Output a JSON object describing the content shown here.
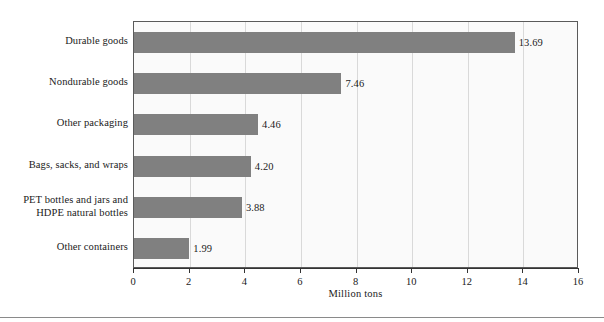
{
  "chart_data": {
    "type": "bar",
    "orientation": "horizontal",
    "title": "",
    "subtitle": "",
    "xlabel": "Million tons",
    "ylabel": "",
    "xlim": [
      0,
      16
    ],
    "xticks": [
      0,
      2,
      4,
      6,
      8,
      10,
      12,
      14,
      16
    ],
    "xtick_labels": [
      "0",
      "2",
      "4",
      "6",
      "8",
      "10",
      "12",
      "14",
      "16"
    ],
    "grid": "vertical",
    "legend": "none",
    "bar_color": "#808080",
    "plot_background": "#fafafa",
    "categories": [
      "Durable goods",
      "Nondurable goods",
      "Other packaging",
      "Bags, sacks, and wraps",
      "PET bottles and jars and HDPE natural bottles",
      "Other containers"
    ],
    "category_label_lines": [
      [
        "Durable goods"
      ],
      [
        "Nondurable goods"
      ],
      [
        "Other packaging"
      ],
      [
        "Bags, sacks, and wraps"
      ],
      [
        "PET bottles and jars and",
        "HDPE natural bottles"
      ],
      [
        "Other containers"
      ]
    ],
    "values": [
      13.69,
      7.46,
      4.46,
      4.2,
      3.88,
      1.99
    ],
    "value_labels": [
      "13.69",
      "7.46",
      "4.46",
      "4.20",
      "3.88",
      "1.99"
    ]
  }
}
